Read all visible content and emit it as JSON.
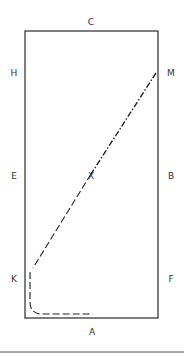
{
  "diagram": {
    "type": "dressage-arena",
    "colors": {
      "arena_border": "#3a3a3a",
      "path": "#222222",
      "label": "#333333",
      "rule": "#555555"
    },
    "markers": {
      "C": "C",
      "H": "H",
      "M": "M",
      "E": "E",
      "X": "X",
      "B": "B",
      "K": "K",
      "F": "F",
      "A": "A"
    },
    "path_description": "From M, diagonal dash-dot line through X toward K, then dashed curve along track past K turning toward A"
  }
}
